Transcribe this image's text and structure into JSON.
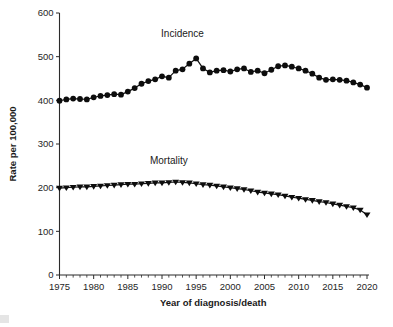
{
  "chart_data": {
    "type": "line",
    "title": "",
    "subtitle": "",
    "xlabel": "Year of diagnosis/death",
    "ylabel": "Rate per 100,000",
    "xlim": [
      1975,
      2020
    ],
    "ylim": [
      0,
      600
    ],
    "grid": false,
    "legend_position": "inline-annotations",
    "x_ticks_major": [
      1975,
      1980,
      1985,
      1990,
      1995,
      2000,
      2005,
      2010,
      2015,
      2020
    ],
    "x_tick_labels": [
      "1975",
      "1980",
      "1985",
      "1990",
      "1995",
      "2000",
      "2005",
      "2010",
      "2015",
      "2020"
    ],
    "x_ticks_minor_step": 1,
    "y_ticks": [
      0,
      100,
      200,
      300,
      400,
      500,
      600
    ],
    "y_tick_labels": [
      "0",
      "100",
      "200",
      "300",
      "400",
      "500",
      "600"
    ],
    "annotations": [
      {
        "text": "Incidence",
        "x": 1993,
        "y": 545
      },
      {
        "text": "Mortality",
        "x": 1991,
        "y": 255
      }
    ],
    "x": [
      1975,
      1976,
      1977,
      1978,
      1979,
      1980,
      1981,
      1982,
      1983,
      1984,
      1985,
      1986,
      1987,
      1988,
      1989,
      1990,
      1991,
      1992,
      1993,
      1994,
      1995,
      1996,
      1997,
      1998,
      1999,
      2000,
      2001,
      2002,
      2003,
      2004,
      2005,
      2006,
      2007,
      2008,
      2009,
      2010,
      2011,
      2012,
      2013,
      2014,
      2015,
      2016,
      2017,
      2018,
      2019,
      2020
    ],
    "series": [
      {
        "name": "Incidence",
        "marker": "circle",
        "color": "#0d0d0d",
        "values": [
          399,
          402,
          404,
          403,
          402,
          407,
          410,
          412,
          414,
          413,
          420,
          428,
          438,
          444,
          448,
          455,
          452,
          468,
          471,
          484,
          496,
          473,
          464,
          468,
          469,
          466,
          471,
          473,
          465,
          468,
          462,
          470,
          478,
          480,
          477,
          473,
          468,
          461,
          452,
          447,
          448,
          447,
          445,
          441,
          436,
          429
        ],
        "units": "per 100,000"
      },
      {
        "name": "Mortality",
        "marker": "triangle-down",
        "color": "#0d0d0d",
        "values": [
          199,
          200,
          201,
          202,
          202,
          203,
          204,
          205,
          206,
          207,
          208,
          208,
          209,
          210,
          211,
          211,
          212,
          213,
          212,
          211,
          209,
          207,
          206,
          204,
          202,
          200,
          198,
          196,
          193,
          190,
          188,
          186,
          184,
          181,
          178,
          176,
          173,
          171,
          168,
          166,
          163,
          160,
          157,
          154,
          149,
          138
        ],
        "units": "per 100,000"
      }
    ]
  },
  "figure": {
    "background_color": "#ffffff",
    "foreground_color": "#1a1a1a"
  }
}
